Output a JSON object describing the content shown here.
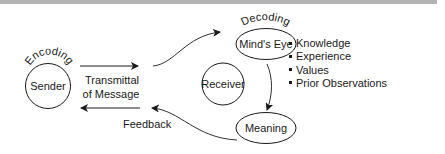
{
  "diagram": {
    "nodes": {
      "sender": "Sender",
      "receiver": "Receiver",
      "minds_eye": "Mind's Eye",
      "meaning": "Meaning"
    },
    "arc_labels": {
      "encoding": "Encoding",
      "decoding": "Decoding"
    },
    "edge_labels": {
      "transmittal_line1": "Transmittal",
      "transmittal_line2": "of Message",
      "feedback": "Feedback"
    },
    "minds_eye_factors": [
      "Knowledge",
      "Experience",
      "Values",
      "Prior Observations"
    ],
    "colors": {
      "stroke": "#1a1a1a",
      "top_band": "#b4b4b4",
      "background": "#ffffff"
    }
  }
}
